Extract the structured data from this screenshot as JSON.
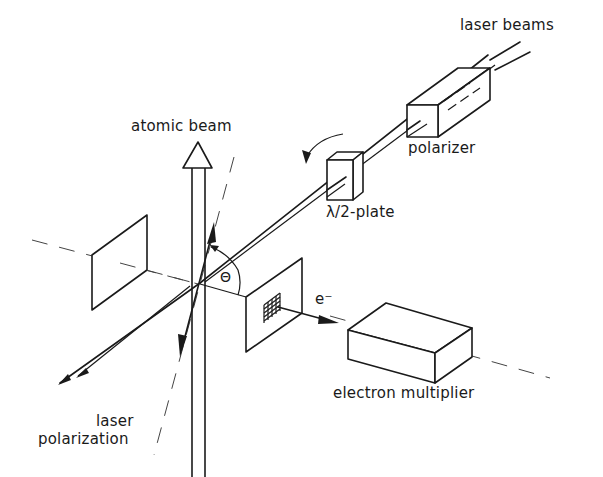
{
  "figure": {
    "labels": {
      "laser_beams": "laser beams",
      "polarizer": "polarizer",
      "half_wave_plate": "λ/2-plate",
      "atomic_beam": "atomic beam",
      "theta": "Θ",
      "electron": "e⁻",
      "electron_multiplier": "electron multiplier",
      "laser_polarization_line1": "laser",
      "laser_polarization_line2": "polarization"
    },
    "colors": {
      "ink": "#1a1a1a",
      "background": "#ffffff"
    }
  }
}
